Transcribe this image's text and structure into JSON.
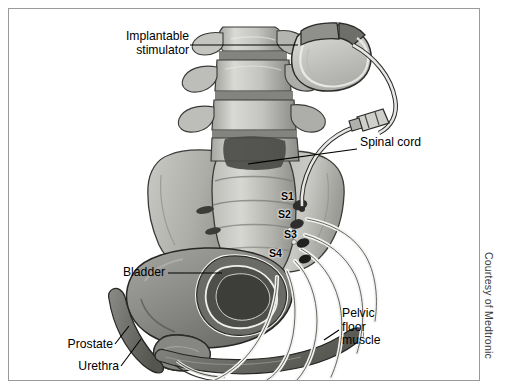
{
  "figure": {
    "credit": "Courtesy of Medtronic",
    "border_color": "#9a9a9a",
    "background_color": "#ffffff"
  },
  "labels": {
    "implantable_stimulator": "Implantable\nstimulator",
    "spinal_cord": "Spinal cord",
    "bladder": "Bladder",
    "prostate": "Prostate",
    "urethra": "Urethra",
    "pelvic_floor_muscle": "Pelvic\nfloor\nmuscle"
  },
  "foramina": [
    {
      "id": "s1",
      "label": "S1"
    },
    {
      "id": "s2",
      "label": "S2"
    },
    {
      "id": "s3",
      "label": "S3"
    },
    {
      "id": "s4",
      "label": "S4"
    }
  ],
  "anatomy": {
    "vertebrae": "lumbar-vertebrae",
    "sacrum": "sacrum-pelvis",
    "bladder": "bladder-cutaway",
    "prostate": "prostate",
    "urethra": "urethra",
    "pelvic_floor": "pelvic-floor-muscle",
    "nerves": "sacral-nerve-roots"
  },
  "device": {
    "pulse_generator": "implantable-pulse-generator",
    "header": "lead-header-block",
    "lead": "stimulation-lead",
    "connector": "inline-lead-connector"
  },
  "palette": {
    "bone_light": "#cfcfcb",
    "bone_mid": "#a8a8a3",
    "bone_dark": "#6f6f6c",
    "organ_mid": "#8e8e8a",
    "organ_dark": "#5d5d5a",
    "muscle": "#7a7a76",
    "nerve": "#efefee",
    "outline": "#2b2b2b",
    "device_fill": "#c6c6c3",
    "device_header": "#8d8d8a"
  }
}
